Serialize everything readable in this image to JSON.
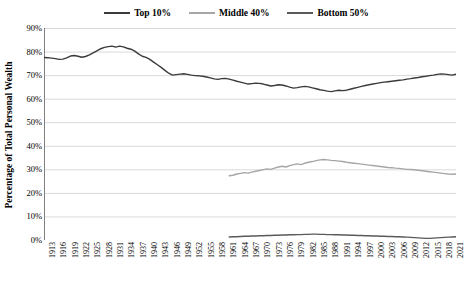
{
  "chart_data": {
    "type": "line",
    "title": "",
    "xlabel": "",
    "ylabel": "Percentage of Total Personal Wealth",
    "ylim": [
      0,
      0.9
    ],
    "ytick_labels": [
      "0%",
      "10%",
      "20%",
      "30%",
      "40%",
      "50%",
      "60%",
      "70%",
      "80%",
      "90%"
    ],
    "ytick_values": [
      0,
      10,
      20,
      30,
      40,
      50,
      60,
      70,
      80,
      90
    ],
    "grid": true,
    "legend_position": "top-center",
    "xtick_labels": [
      "1913",
      "1916",
      "1919",
      "1922",
      "1925",
      "1928",
      "1931",
      "1934",
      "1937",
      "1940",
      "1943",
      "1946",
      "1949",
      "1952",
      "1955",
      "1958",
      "1961",
      "1964",
      "1967",
      "1970",
      "1973",
      "1976",
      "1979",
      "1982",
      "1985",
      "1988",
      "1991",
      "1994",
      "1997",
      "2000",
      "2003",
      "2006",
      "2009",
      "2012",
      "2015",
      "2018",
      "2021"
    ],
    "xlim": [
      1913,
      2022
    ],
    "series": [
      {
        "name": "Top 10%",
        "color": "#3b3b3b",
        "x_start": 1913,
        "values": [
          77.5,
          77.4,
          77.2,
          77.0,
          76.7,
          76.8,
          77.3,
          78.1,
          78.3,
          78.0,
          77.6,
          77.9,
          78.6,
          79.4,
          80.3,
          81.2,
          81.8,
          82.1,
          82.3,
          81.9,
          82.3,
          82.0,
          81.4,
          81.0,
          80.2,
          79.0,
          78.0,
          77.5,
          76.7,
          75.5,
          74.4,
          73.3,
          72.0,
          70.8,
          70.0,
          70.2,
          70.4,
          70.6,
          70.3,
          70.0,
          69.8,
          69.7,
          69.5,
          69.2,
          68.8,
          68.4,
          68.2,
          68.5,
          68.6,
          68.3,
          67.9,
          67.4,
          67.0,
          66.6,
          66.2,
          66.4,
          66.6,
          66.5,
          66.2,
          65.8,
          65.4,
          65.6,
          65.9,
          65.8,
          65.4,
          64.9,
          64.5,
          64.7,
          65.0,
          65.2,
          65.0,
          64.6,
          64.2,
          63.8,
          63.5,
          63.2,
          63.0,
          63.3,
          63.6,
          63.4,
          63.6,
          64.0,
          64.4,
          64.8,
          65.2,
          65.6,
          65.9,
          66.2,
          66.5,
          66.8,
          67.0,
          67.2,
          67.4,
          67.6,
          67.8,
          68.0,
          68.3,
          68.5,
          68.8,
          69.0,
          69.3,
          69.5,
          69.8,
          70.0,
          70.3,
          70.5,
          70.4,
          70.2,
          70.0,
          70.4,
          70.2,
          69.8,
          70.0,
          69.9,
          69.8,
          70.0
        ]
      },
      {
        "name": "Middle 40%",
        "color": "#a6a6a6",
        "x_start": 1962,
        "values": [
          27.3,
          27.5,
          28.0,
          28.3,
          28.6,
          28.4,
          28.8,
          29.2,
          29.5,
          29.9,
          30.2,
          30.0,
          30.5,
          31.0,
          31.3,
          31.0,
          31.6,
          32.0,
          32.3,
          32.0,
          32.6,
          33.0,
          33.3,
          33.7,
          34.0,
          34.2,
          34.0,
          33.8,
          33.7,
          33.5,
          33.3,
          33.0,
          32.8,
          32.6,
          32.4,
          32.2,
          32.0,
          31.8,
          31.6,
          31.4,
          31.2,
          31.0,
          30.8,
          30.7,
          30.5,
          30.4,
          30.2,
          30.0,
          29.9,
          29.8,
          29.6,
          29.4,
          29.2,
          29.0,
          28.8,
          28.6,
          28.4,
          28.2,
          28.0,
          27.9,
          28.0,
          28.0
        ]
      },
      {
        "name": "Bottom 50%",
        "color": "#5a5a5a",
        "x_start": 1962,
        "values": [
          1.3,
          1.4,
          1.4,
          1.5,
          1.6,
          1.6,
          1.7,
          1.7,
          1.8,
          1.8,
          1.9,
          1.9,
          2.0,
          2.0,
          2.1,
          2.1,
          2.2,
          2.2,
          2.3,
          2.3,
          2.4,
          2.4,
          2.5,
          2.5,
          2.4,
          2.4,
          2.3,
          2.3,
          2.2,
          2.2,
          2.1,
          2.1,
          2.0,
          2.0,
          1.9,
          1.9,
          1.8,
          1.8,
          1.7,
          1.7,
          1.6,
          1.6,
          1.5,
          1.5,
          1.4,
          1.4,
          1.3,
          1.2,
          1.1,
          1.0,
          0.9,
          0.8,
          0.7,
          0.7,
          0.8,
          0.9,
          1.0,
          1.1,
          1.2,
          1.3,
          1.4,
          1.5
        ]
      }
    ]
  },
  "legend": {
    "items": [
      {
        "label": "Top 10%",
        "color": "#3b3b3b"
      },
      {
        "label": "Middle 40%",
        "color": "#a6a6a6"
      },
      {
        "label": "Bottom 50%",
        "color": "#5a5a5a"
      }
    ]
  }
}
